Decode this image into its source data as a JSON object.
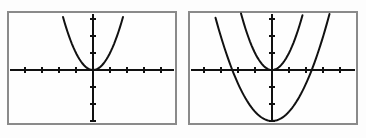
{
  "figure": {
    "panel_count": 2,
    "background_color": "#fdfdfd",
    "frame_color": "#808080",
    "curve_color": "#111111",
    "axis_color": "#111111"
  },
  "panels": [
    {
      "name": "left-panel",
      "label": "Graph 1",
      "frame": {
        "x": 7,
        "y": 11,
        "width": 170,
        "height": 114
      },
      "axes": {
        "origin_x": 93,
        "origin_y": 70,
        "x_tick_spacing": 17,
        "y_tick_spacing": 17,
        "x_tick_count": 9,
        "y_tick_count": 6,
        "xlim": [
          -5,
          5
        ],
        "ylim": [
          -3.4,
          3.4
        ],
        "grid": false
      },
      "curves": [
        {
          "name": "narrow-parabola",
          "equation": "y = x^2",
          "vertex": [
            0,
            0
          ],
          "a": 1,
          "opens": "up",
          "color": "#111111"
        }
      ]
    },
    {
      "name": "right-panel",
      "label": "Graph 2",
      "frame": {
        "x": 188,
        "y": 11,
        "width": 170,
        "height": 114
      },
      "axes": {
        "origin_x": 272,
        "origin_y": 70,
        "x_tick_spacing": 17,
        "y_tick_spacing": 17,
        "x_tick_count": 9,
        "y_tick_count": 6,
        "xlim": [
          -5,
          5
        ],
        "ylim": [
          -3.4,
          3.4
        ],
        "grid": false
      },
      "curves": [
        {
          "name": "narrow-parabola",
          "equation": "y = x^2",
          "vertex": [
            0,
            0
          ],
          "a": 1,
          "opens": "up",
          "color": "#111111"
        },
        {
          "name": "wide-shifted-parabola",
          "equation": "y = x^2 - 4",
          "vertex": [
            0,
            -3
          ],
          "a": 0.55,
          "opens": "up",
          "x_intercepts": [
            -2.3,
            2.3
          ],
          "color": "#111111"
        }
      ]
    }
  ],
  "chart_data": [
    {
      "type": "line",
      "title": "Graph 1",
      "xlabel": "x",
      "ylabel": "y",
      "xlim": [
        -5,
        5
      ],
      "ylim": [
        -3.4,
        3.4
      ],
      "grid": false,
      "legend": "none",
      "series": [
        {
          "name": "y = x^2",
          "x": [
            -1.9,
            -1.6,
            -1.3,
            -1.0,
            -0.7,
            -0.4,
            0,
            0.4,
            0.7,
            1.0,
            1.3,
            1.6,
            1.9
          ],
          "values": [
            3.61,
            2.56,
            1.69,
            1.0,
            0.49,
            0.16,
            0,
            0.16,
            0.49,
            1.0,
            1.69,
            2.56,
            3.61
          ]
        }
      ]
    },
    {
      "type": "line",
      "title": "Graph 2",
      "xlabel": "x",
      "ylabel": "y",
      "xlim": [
        -5,
        5
      ],
      "ylim": [
        -3.4,
        3.4
      ],
      "grid": false,
      "legend": "none",
      "series": [
        {
          "name": "y = x^2",
          "x": [
            -1.9,
            -1.6,
            -1.3,
            -1.0,
            -0.7,
            -0.4,
            0,
            0.4,
            0.7,
            1.0,
            1.3,
            1.6,
            1.9
          ],
          "values": [
            3.61,
            2.56,
            1.69,
            1.0,
            0.49,
            0.16,
            0,
            0.16,
            0.49,
            1.0,
            1.69,
            2.56,
            3.61
          ]
        },
        {
          "name": "y = 0.55x^2 - 3",
          "x": [
            -3.5,
            -3.0,
            -2.5,
            -2.0,
            -1.5,
            -1.0,
            -0.5,
            0,
            0.5,
            1.0,
            1.5,
            2.0,
            2.5,
            3.0,
            3.5
          ],
          "values": [
            3.74,
            1.95,
            0.44,
            -0.8,
            -1.76,
            -2.45,
            -2.86,
            -3.0,
            -2.86,
            -2.45,
            -1.76,
            -0.8,
            0.44,
            1.95,
            3.74
          ]
        }
      ]
    }
  ]
}
